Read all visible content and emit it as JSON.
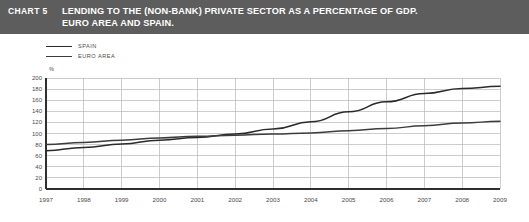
{
  "header": {
    "chart_label": "CHART 5",
    "title_line1": "LENDING TO THE (NON-BANK) PRIVATE SECTOR AS A PERCENTAGE OF GDP.",
    "title_line2": "EURO AREA AND SPAIN.",
    "band_color": "#5d5d5d",
    "text_color": "#ffffff"
  },
  "legend": {
    "items": [
      {
        "label": "SPAIN",
        "color": "#2a2a2a"
      },
      {
        "label": "EURO AREA",
        "color": "#3c3c3c"
      }
    ]
  },
  "chart_data": {
    "type": "line",
    "title": "LENDING TO THE (NON-BANK) PRIVATE SECTOR AS A PERCENTAGE OF GDP. EURO AREA AND SPAIN.",
    "xlabel": "",
    "ylabel": "",
    "unit_label": "%",
    "grid": true,
    "legend_position": "top-left",
    "x": [
      1997,
      1998,
      1999,
      2000,
      2001,
      2002,
      2003,
      2004,
      2005,
      2006,
      2007,
      2008,
      2009
    ],
    "xtick_labels": [
      "1997",
      "1998",
      "1999",
      "2000",
      "2001",
      "2002",
      "2003",
      "2004",
      "2005",
      "2006",
      "2007",
      "2008",
      "2009"
    ],
    "xlim": [
      1997,
      2009
    ],
    "ylim": [
      0,
      200
    ],
    "ytick_labels": [
      "0",
      "20",
      "40",
      "60",
      "80",
      "100",
      "120",
      "140",
      "160",
      "180",
      "200"
    ],
    "yticks": [
      0,
      20,
      40,
      60,
      80,
      100,
      120,
      140,
      160,
      180,
      200
    ],
    "series": [
      {
        "name": "SPAIN",
        "color": "#2a2a2a",
        "values": [
          69,
          75,
          81,
          88,
          93,
          99,
          108,
          121,
          139,
          157,
          172,
          181,
          185
        ]
      },
      {
        "name": "EURO AREA",
        "color": "#3c3c3c",
        "values": [
          80,
          84,
          88,
          92,
          95,
          97,
          99,
          101,
          105,
          109,
          114,
          119,
          122
        ]
      }
    ]
  }
}
